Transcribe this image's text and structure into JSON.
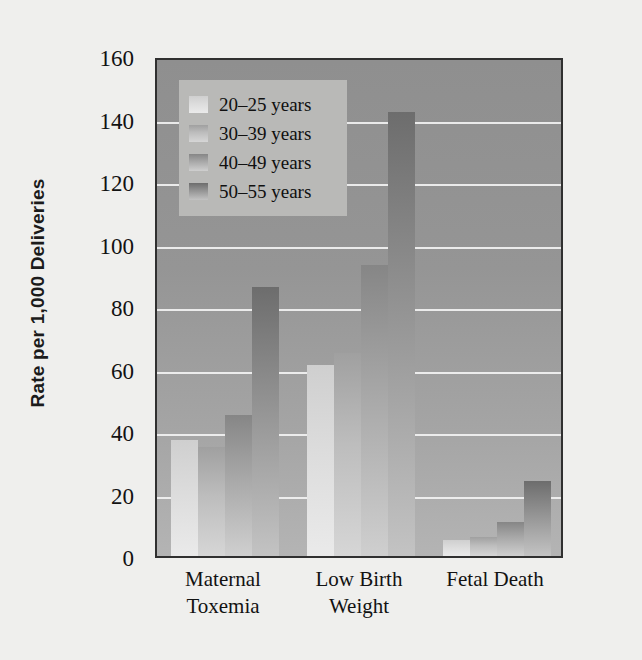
{
  "chart_data": {
    "type": "bar",
    "title": "",
    "xlabel": "",
    "ylabel": "Rate per 1,000 Deliveries",
    "ylim": [
      0,
      160
    ],
    "yticks": [
      0,
      20,
      40,
      60,
      80,
      100,
      120,
      140,
      160
    ],
    "grid": true,
    "legend_position": "top-left",
    "categories": [
      "Maternal Toxemia",
      "Low Birth Weight",
      "Fetal Death"
    ],
    "category_lines": [
      [
        "Maternal",
        "Toxemia"
      ],
      [
        "Low Birth",
        "Weight"
      ],
      [
        "Fetal Death",
        ""
      ]
    ],
    "series": [
      {
        "name": "20–25 years",
        "values": [
          37,
          61,
          5
        ],
        "color": "#dcdcdc"
      },
      {
        "name": "30–39 years",
        "values": [
          35,
          65,
          6
        ],
        "color": "#bdbdbd"
      },
      {
        "name": "40–49 years",
        "values": [
          45,
          93,
          11
        ],
        "color": "#a8a8a8"
      },
      {
        "name": "50–55 years",
        "values": [
          86,
          142,
          24
        ],
        "color": "#949494"
      }
    ]
  },
  "colors": {
    "plot_background": "#9a9a9a",
    "gridline": "#f2f2f2",
    "axis": "#303030",
    "page_background": "#efefed",
    "legend_background": "#b9b9b7",
    "text": "#121212"
  }
}
